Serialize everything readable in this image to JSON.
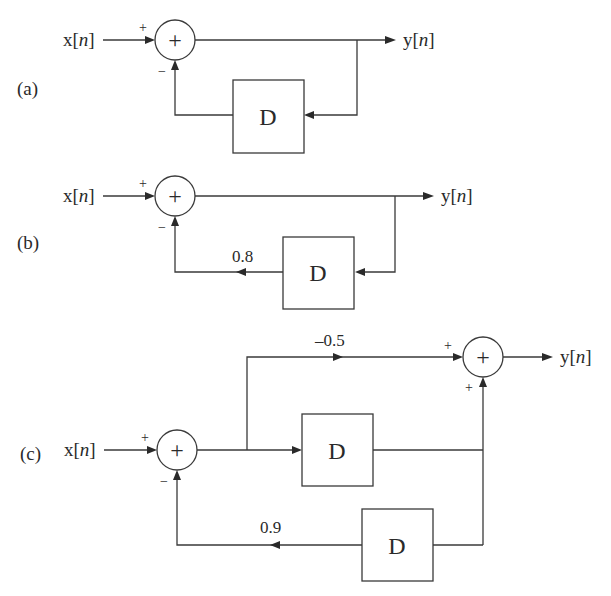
{
  "diagrams": [
    {
      "id": "a",
      "label": "(a)",
      "input": {
        "pre": "x[",
        "var": "n",
        "post": "]"
      },
      "output": {
        "pre": "y[",
        "var": "n",
        "post": "]"
      },
      "adder": {
        "symbol": "+",
        "in_sign": "+",
        "fb_sign": "−"
      },
      "delay_label": "D",
      "feedback_gain": null
    },
    {
      "id": "b",
      "label": "(b)",
      "input": {
        "pre": "x[",
        "var": "n",
        "post": "]"
      },
      "output": {
        "pre": "y[",
        "var": "n",
        "post": "]"
      },
      "adder": {
        "symbol": "+",
        "in_sign": "+",
        "fb_sign": "−"
      },
      "delay_label": "D",
      "feedback_gain": "0.8"
    },
    {
      "id": "c",
      "label": "(c)",
      "input": {
        "pre": "x[",
        "var": "n",
        "post": "]"
      },
      "output": {
        "pre": "y[",
        "var": "n",
        "post": "]"
      },
      "adder1": {
        "symbol": "+",
        "in_sign": "+",
        "fb_sign": "−"
      },
      "adder2": {
        "symbol": "+",
        "top_sign": "+",
        "bottom_sign": "+"
      },
      "feedforward_gain": "–0.5",
      "delay1_label": "D",
      "delay2_label": "D",
      "feedback_gain": "0.9"
    }
  ],
  "colors": {
    "stroke": "#3a3a3a",
    "text": "#2a2a2a",
    "background": "#ffffff"
  }
}
